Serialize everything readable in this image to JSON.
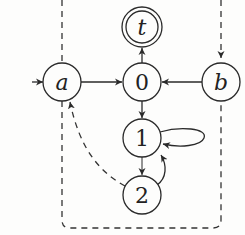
{
  "diagram": {
    "type": "state-machine",
    "nodes": [
      {
        "id": "a",
        "label": "a",
        "italic": true,
        "initial": true
      },
      {
        "id": "0",
        "label": "0",
        "italic": false
      },
      {
        "id": "b",
        "label": "b",
        "italic": true
      },
      {
        "id": "t",
        "label": "t",
        "italic": true,
        "accepting": true
      },
      {
        "id": "1",
        "label": "1",
        "italic": false
      },
      {
        "id": "2",
        "label": "2",
        "italic": false
      }
    ],
    "edges": [
      {
        "from": "start",
        "to": "a",
        "style": "solid"
      },
      {
        "from": "a",
        "to": "0",
        "style": "solid"
      },
      {
        "from": "b",
        "to": "0",
        "style": "solid"
      },
      {
        "from": "0",
        "to": "t",
        "style": "solid"
      },
      {
        "from": "0",
        "to": "1",
        "style": "solid"
      },
      {
        "from": "1",
        "to": "1",
        "style": "solid",
        "self_loop": true
      },
      {
        "from": "1",
        "to": "2",
        "style": "solid"
      },
      {
        "from": "2",
        "to": "1",
        "style": "solid"
      },
      {
        "from": "2",
        "to": "a",
        "style": "dashed"
      },
      {
        "from": "a",
        "to": "b",
        "style": "dashed",
        "via": "outer dashed boundary"
      }
    ],
    "colors": {
      "stroke": "#2a2a2a",
      "background": "#fdfdfc"
    }
  }
}
